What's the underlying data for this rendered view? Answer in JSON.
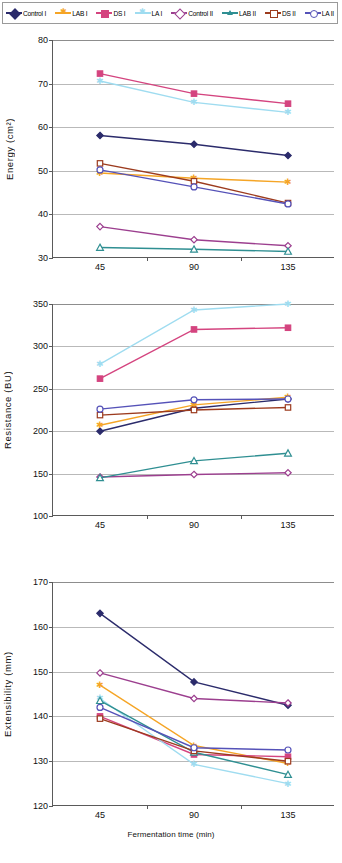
{
  "legend": {
    "items": [
      {
        "label": "Control I",
        "color": "#2b2b6b",
        "marker": "diamond",
        "filled": true
      },
      {
        "label": "LAB I",
        "color": "#f5a526",
        "marker": "star",
        "filled": true
      },
      {
        "label": "DS I",
        "color": "#d4447f",
        "marker": "square",
        "filled": true
      },
      {
        "label": "LA I",
        "color": "#9fdcf0",
        "marker": "star",
        "filled": true
      },
      {
        "label": "Control II",
        "color": "#9c3f8f",
        "marker": "diamond",
        "filled": false
      },
      {
        "label": "LAB II",
        "color": "#2f8f92",
        "marker": "triangle",
        "filled": false
      },
      {
        "label": "DS II",
        "color": "#9c3b1e",
        "marker": "square",
        "filled": false
      },
      {
        "label": "LA II",
        "color": "#5552b8",
        "marker": "circle",
        "filled": false
      }
    ]
  },
  "chart_data": [
    {
      "type": "line",
      "id": "energy",
      "title": "",
      "xlabel": "",
      "ylabel": "E nargy (cm2)",
      "ylabel_display": "Energy (cm²)",
      "categories": [
        "45",
        "90",
        "135"
      ],
      "x": [
        45,
        90,
        135
      ],
      "ylim": [
        30,
        80
      ],
      "yticks": [
        30,
        40,
        50,
        60,
        70,
        80
      ],
      "grid": true,
      "legend_position": "top",
      "series": [
        {
          "name": "Control I",
          "values": [
            58.1,
            56.1,
            53.5
          ]
        },
        {
          "name": "LAB I",
          "values": [
            49.5,
            48.3,
            47.4
          ]
        },
        {
          "name": "DS I",
          "values": [
            72.3,
            67.7,
            65.4
          ]
        },
        {
          "name": "LA I",
          "values": [
            70.6,
            65.7,
            63.4
          ]
        },
        {
          "name": "Control II",
          "values": [
            37.2,
            34.2,
            32.8
          ]
        },
        {
          "name": "LAB II",
          "values": [
            32.4,
            32.0,
            31.5
          ]
        },
        {
          "name": "DS II",
          "values": [
            51.7,
            47.6,
            42.6
          ]
        },
        {
          "name": "LA II",
          "values": [
            50.2,
            46.3,
            42.4
          ]
        }
      ]
    },
    {
      "type": "line",
      "id": "resistance",
      "title": "",
      "xlabel": "",
      "ylabel": "Resistance (B U )",
      "ylabel_display": "Resistance (BU)",
      "categories": [
        "45",
        "90",
        "135"
      ],
      "x": [
        45,
        90,
        135
      ],
      "ylim": [
        100,
        350
      ],
      "yticks": [
        100,
        150,
        200,
        250,
        300,
        350
      ],
      "grid": true,
      "legend_position": "top",
      "series": [
        {
          "name": "Control I",
          "values": [
            200,
            227,
            238
          ]
        },
        {
          "name": "LAB I",
          "values": [
            207,
            231,
            240
          ]
        },
        {
          "name": "DS I",
          "values": [
            262,
            320,
            322
          ]
        },
        {
          "name": "LA I",
          "values": [
            279,
            343,
            350
          ]
        },
        {
          "name": "Control II",
          "values": [
            146,
            149,
            151
          ]
        },
        {
          "name": "LAB II",
          "values": [
            145,
            165,
            174
          ]
        },
        {
          "name": "DS II",
          "values": [
            219,
            225,
            228
          ]
        },
        {
          "name": "LA II",
          "values": [
            226,
            237,
            238
          ]
        }
      ]
    },
    {
      "type": "line",
      "id": "extensibility",
      "title": "",
      "xlabel": "Fermentation time (min)",
      "ylabel": "E xtensibility (mm )",
      "ylabel_display": "Extensibility (mm)",
      "categories": [
        "45",
        "90",
        "135"
      ],
      "x": [
        45,
        90,
        135
      ],
      "ylim": [
        120,
        170
      ],
      "yticks": [
        120,
        130,
        140,
        150,
        160,
        170
      ],
      "grid": true,
      "legend_position": "top",
      "series": [
        {
          "name": "Control I",
          "values": [
            163.0,
            147.7,
            142.5
          ]
        },
        {
          "name": "LAB I",
          "values": [
            147.0,
            133.5,
            129.5
          ]
        },
        {
          "name": "DS I",
          "values": [
            140.0,
            131.5,
            131.0
          ]
        },
        {
          "name": "LA I",
          "values": [
            144.0,
            129.3,
            125.0
          ]
        },
        {
          "name": "Control II",
          "values": [
            149.7,
            144.0,
            143.0
          ]
        },
        {
          "name": "LAB II",
          "values": [
            143.5,
            132.0,
            127.0
          ]
        },
        {
          "name": "DS II",
          "values": [
            139.5,
            132.3,
            130.0
          ]
        },
        {
          "name": "LA II",
          "values": [
            142.0,
            133.0,
            132.5
          ]
        }
      ]
    }
  ]
}
